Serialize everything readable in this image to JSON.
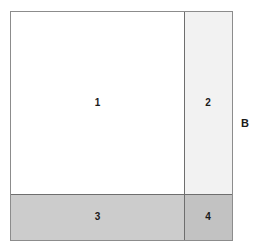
{
  "figure": {
    "type": "mosaic-partition",
    "outer_border_color": "#8c8c8c",
    "divider_color": "#6e6e6e",
    "background_color": "#ffffff",
    "axis_label": "B"
  },
  "cells": [
    {
      "id": "1",
      "label": "1",
      "fill": "#ffffff",
      "position": "top-left"
    },
    {
      "id": "2",
      "label": "2",
      "fill": "#f2f2f2",
      "position": "top-right"
    },
    {
      "id": "3",
      "label": "3",
      "fill": "#cccccc",
      "position": "bottom-left"
    },
    {
      "id": "4",
      "label": "4",
      "fill": "#c2c2c2",
      "position": "bottom-right"
    }
  ],
  "chart_data": {
    "type": "mosaic",
    "title": "",
    "xlabel": "",
    "ylabel": "",
    "annotations": [
      "B"
    ],
    "categories": [
      "1",
      "2",
      "3",
      "4"
    ],
    "values": [
      1,
      2,
      3,
      4
    ],
    "grid": false,
    "legend": "none"
  }
}
